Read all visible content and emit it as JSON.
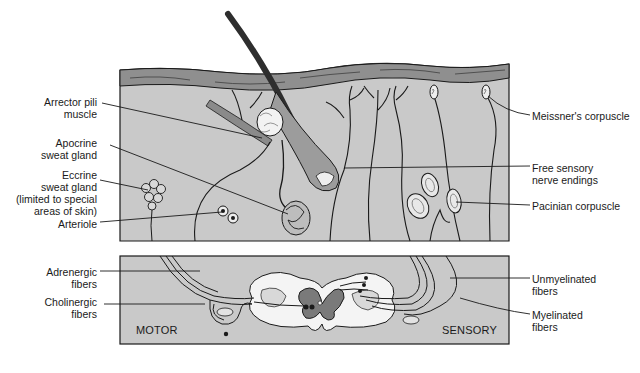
{
  "diagram": {
    "type": "anatomical-illustration",
    "colors": {
      "panel_fill": "#c9c9c9",
      "epidermis": "#8f8f8f",
      "cord_gray_matter": "#7a7a7a",
      "white_matter": "#f4f4f4",
      "outline": "#1a1a1a",
      "hair": "#3a3a3a"
    }
  },
  "skin_panel": {
    "left_labels": [
      {
        "line1": "Arrector pili",
        "line2": "muscle"
      },
      {
        "line1": "Apocrine",
        "line2": "sweat gland"
      },
      {
        "line1": "Eccrine",
        "line2": "sweat gland",
        "line3": "(limited to special",
        "line4": "areas of skin)"
      },
      {
        "line1": "Arteriole"
      }
    ],
    "right_labels": [
      {
        "line1": "Meissner's corpuscle"
      },
      {
        "line1": "Free sensory",
        "line2": "nerve endings"
      },
      {
        "line1": "Pacinian corpuscle"
      }
    ]
  },
  "spinal_panel": {
    "left_labels": [
      {
        "line1": "Adrenergic",
        "line2": "fibers"
      },
      {
        "line1": "Cholinergic",
        "line2": "fibers"
      }
    ],
    "right_labels": [
      {
        "line1": "Unmyelinated",
        "line2": "fibers"
      },
      {
        "line1": "Myelinated",
        "line2": "fibers"
      }
    ],
    "motor_tag": "MOTOR",
    "sensory_tag": "SENSORY"
  }
}
